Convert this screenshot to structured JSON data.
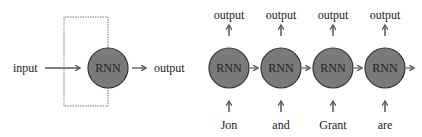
{
  "colors": {
    "node_fill": "#7a7a7a",
    "stroke": "#333333",
    "arrow": "#555555",
    "loop": "#666666"
  },
  "left": {
    "input_label": "input",
    "node_label": "RNN",
    "output_label": "output"
  },
  "right": {
    "steps": [
      {
        "input": "Jon",
        "node": "RNN",
        "output": "output"
      },
      {
        "input": "and",
        "node": "RNN",
        "output": "output"
      },
      {
        "input": "Grant",
        "node": "RNN",
        "output": "output"
      },
      {
        "input": "are",
        "node": "RNN",
        "output": "output"
      }
    ]
  }
}
